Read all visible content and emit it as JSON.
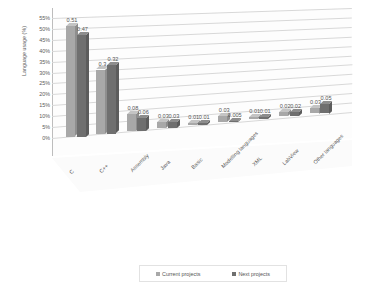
{
  "chart_data": {
    "type": "bar",
    "title": "",
    "xlabel": "",
    "ylabel": "Language usage (%)",
    "ylim": [
      0,
      0.55
    ],
    "grid": true,
    "legend_position": "bottom",
    "categories": [
      "C",
      "C++",
      "Assembly",
      "Java",
      "Basic",
      "Modelling languages",
      "XML",
      "LabView",
      "Other languages"
    ],
    "ytick_labels": [
      "0%",
      "5%",
      "10%",
      "15%",
      "20%",
      "25%",
      "30%",
      "35%",
      "40%",
      "45%",
      "50%",
      "55%"
    ],
    "ytick_values": [
      0,
      0.05,
      0.1,
      0.15,
      0.2,
      0.25,
      0.3,
      0.35,
      0.4,
      0.45,
      0.5,
      0.55
    ],
    "series": [
      {
        "name": "Current projects",
        "color": "#a8a8a8",
        "values": [
          0.51,
          0.3,
          0.08,
          0.03,
          0.01,
          0.03,
          0.01,
          0.02,
          0.03
        ],
        "labels": [
          "0.51",
          "0.3",
          "0.08",
          "0.03",
          "0.01",
          "0.03",
          "0.01",
          "0.02",
          "0.03"
        ]
      },
      {
        "name": "Next projects",
        "color": "#6f6f6f",
        "values": [
          0.47,
          0.32,
          0.06,
          0.03,
          0.01,
          0.005,
          0.01,
          0.02,
          0.05
        ],
        "labels": [
          "0.47",
          "0.32",
          "0.06",
          "0.03",
          "0.01",
          "0.005",
          "0.01",
          "0.02",
          "0.05"
        ]
      }
    ]
  },
  "legend": {
    "items": [
      {
        "label": "Current projects",
        "color": "#a8a8a8"
      },
      {
        "label": "Next projects",
        "color": "#6f6f6f"
      }
    ]
  }
}
